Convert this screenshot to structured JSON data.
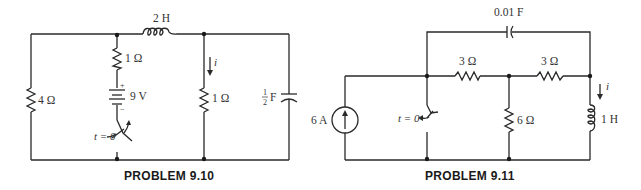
{
  "problems": [
    {
      "id": "9.10",
      "caption": "PROBLEM 9.10",
      "components": {
        "inductor": {
          "label": "2 H"
        },
        "series_resistor": {
          "label": "1 Ω"
        },
        "battery": {
          "label": "9 V",
          "plus": "+",
          "minus": "−"
        },
        "switch": {
          "label": "t = 0",
          "state": "opens"
        },
        "left_resistor": {
          "label": "4 Ω"
        },
        "middle_resistor": {
          "label": "1 Ω"
        },
        "current": {
          "label": "i"
        },
        "capacitor": {
          "num": "1",
          "den": "2",
          "unit": "F"
        }
      }
    },
    {
      "id": "9.11",
      "caption": "PROBLEM 9.11",
      "components": {
        "capacitor": {
          "label": "0.01 F"
        },
        "resistor_a": {
          "label": "3 Ω"
        },
        "resistor_b": {
          "label": "3 Ω"
        },
        "current_source": {
          "label": "6 A"
        },
        "switch": {
          "label": "t = 0",
          "state": "closes"
        },
        "shunt_resistor": {
          "label": "6 Ω"
        },
        "current": {
          "label": "i"
        },
        "inductor": {
          "label": "1 H"
        }
      }
    }
  ],
  "colors": {
    "ink": "#2a2a2a",
    "background": "#ffffff"
  }
}
